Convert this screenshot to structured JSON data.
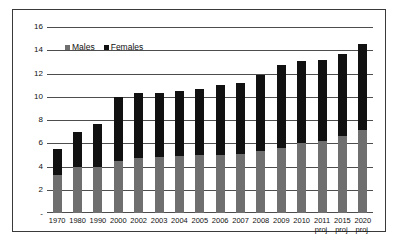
{
  "chart_data": {
    "type": "bar",
    "stacked": true,
    "title": "",
    "xlabel": "",
    "ylabel": "",
    "ylim": [
      0,
      16
    ],
    "yticks": [
      0,
      2,
      4,
      6,
      8,
      10,
      12,
      14,
      16
    ],
    "ytick_labels": [
      "-",
      "2",
      "4",
      "6",
      "8",
      "10",
      "12",
      "14",
      "16"
    ],
    "grid": true,
    "legend_position": "top-left",
    "categories": [
      "1970",
      "1980",
      "1990",
      "2000",
      "2002",
      "2003",
      "2004",
      "2005",
      "2006",
      "2007",
      "2008",
      "2009",
      "2010",
      "2011",
      "2015",
      "2020"
    ],
    "category_notes": [
      "",
      "",
      "",
      "",
      "",
      "",
      "",
      "",
      "",
      "",
      "",
      "",
      "",
      "proj.",
      "proj.",
      "proj."
    ],
    "series": [
      {
        "name": "Males",
        "color": "#6f6f6f",
        "values": [
          3.3,
          4.0,
          4.0,
          4.5,
          4.7,
          4.8,
          4.9,
          5.0,
          5.0,
          5.1,
          5.3,
          5.6,
          6.0,
          6.2,
          6.6,
          7.1
        ]
      },
      {
        "name": "Females",
        "color": "#111111",
        "values": [
          2.2,
          3.0,
          3.7,
          5.5,
          5.6,
          5.5,
          5.6,
          5.7,
          6.0,
          6.1,
          6.6,
          7.1,
          7.1,
          7.0,
          7.1,
          7.4
        ]
      }
    ],
    "totals": [
      5.5,
      7.0,
      7.7,
      10.0,
      10.3,
      10.3,
      10.5,
      10.7,
      11.0,
      11.2,
      11.9,
      12.7,
      13.1,
      13.2,
      13.7,
      14.5
    ]
  },
  "legend": {
    "items": [
      {
        "label": "Males"
      },
      {
        "label": "Females"
      }
    ]
  }
}
